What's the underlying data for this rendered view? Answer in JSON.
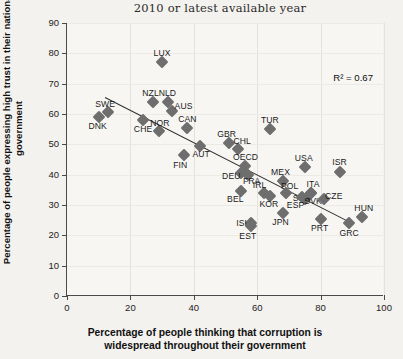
{
  "chart": {
    "title": "2010 or latest available year",
    "xlabel_line1": "Percentage of people thinking that corruption is",
    "xlabel_line2": "widespread throughout their government",
    "ylabel": "Percentage of people expressing high trust in their national government",
    "r2_annotation": "R² = 0.67"
  },
  "chart_data": {
    "type": "scatter",
    "title": "2010 or latest available year",
    "xlabel": "Percentage of people thinking that corruption is widespread throughout their government",
    "ylabel": "Percentage of people expressing high trust in their national government",
    "xlim": [
      0,
      100
    ],
    "ylim": [
      0,
      90
    ],
    "xticks": [
      0,
      20,
      40,
      60,
      80,
      100
    ],
    "yticks": [
      0,
      10,
      20,
      30,
      40,
      50,
      60,
      70,
      80,
      90
    ],
    "grid": true,
    "legend": "none",
    "annotations": [
      {
        "text": "R² = 0.67",
        "x": 84,
        "y": 74
      }
    ],
    "trendline": {
      "x0": 12,
      "y0": 65.5,
      "x1": 89,
      "y1": 24.5,
      "r2": 0.67
    },
    "points": [
      {
        "label": "DNK",
        "x": 10,
        "y": 59,
        "label_dx": -1,
        "label_dy": 9
      },
      {
        "label": "SWE",
        "x": 13,
        "y": 60.5,
        "label_dx": -3,
        "label_dy": -8
      },
      {
        "label": "NZL",
        "x": 27,
        "y": 64,
        "label_dx": -2,
        "label_dy": -9
      },
      {
        "label": "CHE",
        "x": 24,
        "y": 58,
        "label_dx": 0,
        "label_dy": 9
      },
      {
        "label": "NLD",
        "x": 32,
        "y": 64,
        "label_dx": -1,
        "label_dy": -9
      },
      {
        "label": "AUS",
        "x": 33,
        "y": 61,
        "label_dx": 12,
        "label_dy": -5
      },
      {
        "label": "LUX",
        "x": 30,
        "y": 77,
        "label_dx": 0,
        "label_dy": -9
      },
      {
        "label": "NOR",
        "x": 29,
        "y": 54.5,
        "label_dx": 1,
        "label_dy": -8
      },
      {
        "label": "CAN",
        "x": 38,
        "y": 55.5,
        "label_dx": 0,
        "label_dy": -9
      },
      {
        "label": "FIN",
        "x": 37,
        "y": 46.5,
        "label_dx": -4,
        "label_dy": 10
      },
      {
        "label": "AUT",
        "x": 42,
        "y": 49.5,
        "label_dx": 1,
        "label_dy": 8
      },
      {
        "label": "GBR",
        "x": 51,
        "y": 50.5,
        "label_dx": -2,
        "label_dy": -9
      },
      {
        "label": "CHL",
        "x": 54,
        "y": 48.5,
        "label_dx": 4,
        "label_dy": -8
      },
      {
        "label": "OECD",
        "x": 56,
        "y": 43,
        "label_dx": 1,
        "label_dy": -9
      },
      {
        "label": "TUR",
        "x": 64,
        "y": 55,
        "label_dx": 0,
        "label_dy": -9
      },
      {
        "label": "DEU",
        "x": 55,
        "y": 40.5,
        "label_dx": -10,
        "label_dy": 3
      },
      {
        "label": "FRA",
        "x": 57,
        "y": 40,
        "label_dx": 4,
        "label_dy": 6
      },
      {
        "label": "BEL",
        "x": 55,
        "y": 34.5,
        "label_dx": -6,
        "label_dy": 8
      },
      {
        "label": "IRL",
        "x": 62,
        "y": 34,
        "label_dx": -4,
        "label_dy": -8
      },
      {
        "label": "KOR",
        "x": 64,
        "y": 33,
        "label_dx": -1,
        "label_dy": 8
      },
      {
        "label": "ISL",
        "x": 58,
        "y": 24,
        "label_dx": -8,
        "label_dy": 0
      },
      {
        "label": "EST",
        "x": 58,
        "y": 23,
        "label_dx": -3,
        "label_dy": 10
      },
      {
        "label": "JPN",
        "x": 68,
        "y": 27.5,
        "label_dx": -2,
        "label_dy": 9
      },
      {
        "label": "MEX",
        "x": 68,
        "y": 38,
        "label_dx": -2,
        "label_dy": -9
      },
      {
        "label": "POL",
        "x": 69,
        "y": 34,
        "label_dx": 4,
        "label_dy": -7
      },
      {
        "label": "SVN",
        "x": 75,
        "y": 32,
        "label_dx": -3,
        "label_dy": -1
      },
      {
        "label": "ESP",
        "x": 74,
        "y": 32.5,
        "label_dx": -6,
        "label_dy": 8
      },
      {
        "label": "SVK",
        "x": 77,
        "y": 34,
        "label_dx": 2,
        "label_dy": 8
      },
      {
        "label": "ITA",
        "x": 77,
        "y": 34,
        "label_dx": 2,
        "label_dy": -9
      },
      {
        "label": "USA",
        "x": 75,
        "y": 42.5,
        "label_dx": -1,
        "label_dy": -9
      },
      {
        "label": "ISR",
        "x": 86,
        "y": 41,
        "label_dx": 0,
        "label_dy": -10
      },
      {
        "label": "CZE",
        "x": 81,
        "y": 32,
        "label_dx": 10,
        "label_dy": -3
      },
      {
        "label": "PRT",
        "x": 80,
        "y": 25.5,
        "label_dx": -1,
        "label_dy": 9
      },
      {
        "label": "GRC",
        "x": 89,
        "y": 24,
        "label_dx": 0,
        "label_dy": 10
      },
      {
        "label": "HUN",
        "x": 93,
        "y": 26,
        "label_dx": 2,
        "label_dy": -9
      }
    ]
  }
}
